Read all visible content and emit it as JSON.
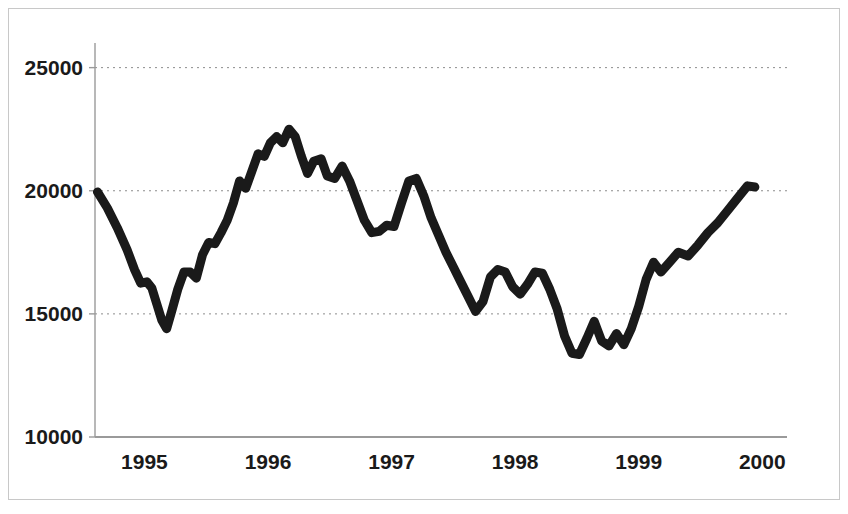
{
  "figure": {
    "background_color": "#ffffff",
    "frame_color": "#c8c8c8",
    "axis_color": "#9a9a9a",
    "gridline_color": "#8c8c8c",
    "line_color": "#1a1a1a"
  },
  "chart_data": {
    "type": "line",
    "title": "",
    "subtitle": "",
    "xlabel": "",
    "ylabel": "",
    "xlim": [
      1994.6,
      2000.2
    ],
    "ylim": [
      10000,
      26000
    ],
    "grid": true,
    "grid_axis": "y",
    "legend": false,
    "legend_position": "none",
    "x_ticks": [
      1995,
      1996,
      1997,
      1998,
      1999,
      2000
    ],
    "x_tick_labels": [
      "1995",
      "1996",
      "1997",
      "1998",
      "1999",
      "2000"
    ],
    "y_ticks": [
      10000,
      15000,
      20000,
      25000
    ],
    "y_tick_labels": [
      "10000",
      "15000",
      "20000",
      "25000"
    ],
    "series": [
      {
        "name": "index",
        "color": "#1a1a1a",
        "line_width": 9,
        "x": [
          1994.62,
          1994.7,
          1994.78,
          1994.86,
          1994.92,
          1994.97,
          1995.02,
          1995.06,
          1995.1,
          1995.14,
          1995.18,
          1995.22,
          1995.27,
          1995.32,
          1995.37,
          1995.42,
          1995.47,
          1995.52,
          1995.57,
          1995.62,
          1995.67,
          1995.72,
          1995.77,
          1995.82,
          1995.87,
          1995.92,
          1995.97,
          1996.02,
          1996.07,
          1996.12,
          1996.17,
          1996.22,
          1996.27,
          1996.32,
          1996.37,
          1996.43,
          1996.48,
          1996.54,
          1996.6,
          1996.66,
          1996.72,
          1996.78,
          1996.84,
          1996.9,
          1996.96,
          1997.02,
          1997.08,
          1997.14,
          1997.2,
          1997.26,
          1997.32,
          1997.38,
          1997.44,
          1997.5,
          1997.56,
          1997.62,
          1997.68,
          1997.74,
          1997.8,
          1997.86,
          1997.92,
          1997.98,
          1998.04,
          1998.1,
          1998.16,
          1998.22,
          1998.28,
          1998.34,
          1998.4,
          1998.46,
          1998.52,
          1998.58,
          1998.64,
          1998.7,
          1998.76,
          1998.82,
          1998.88,
          1998.94,
          1999.0,
          1999.06,
          1999.12,
          1999.18,
          1999.25,
          1999.32,
          1999.4,
          1999.48,
          1999.56,
          1999.64,
          1999.72,
          1999.8,
          1999.88,
          1999.94
        ],
        "y": [
          19950,
          19300,
          18500,
          17600,
          16800,
          16250,
          16300,
          16050,
          15400,
          14750,
          14400,
          15100,
          16000,
          16700,
          16700,
          16450,
          17400,
          17900,
          17850,
          18300,
          18800,
          19500,
          20400,
          20100,
          20800,
          21500,
          21400,
          21950,
          22200,
          21950,
          22500,
          22200,
          21400,
          20700,
          21200,
          21300,
          20600,
          20500,
          21000,
          20400,
          19600,
          18800,
          18300,
          18350,
          18600,
          18550,
          19500,
          20400,
          20500,
          19800,
          18900,
          18200,
          17500,
          16900,
          16300,
          15700,
          15100,
          15500,
          16500,
          16800,
          16700,
          16100,
          15800,
          16200,
          16700,
          16650,
          16000,
          15200,
          14100,
          13400,
          13350,
          14000,
          14700,
          13900,
          13700,
          14200,
          13750,
          14400,
          15300,
          16400,
          17100,
          16700,
          17100,
          17500,
          17350,
          17800,
          18300,
          18700,
          19200,
          19700,
          20200,
          20150
        ]
      }
    ]
  },
  "axes": {
    "plot_left_px": 95,
    "plot_top_px": 43,
    "plot_right_px": 787,
    "plot_bottom_px": 437
  }
}
